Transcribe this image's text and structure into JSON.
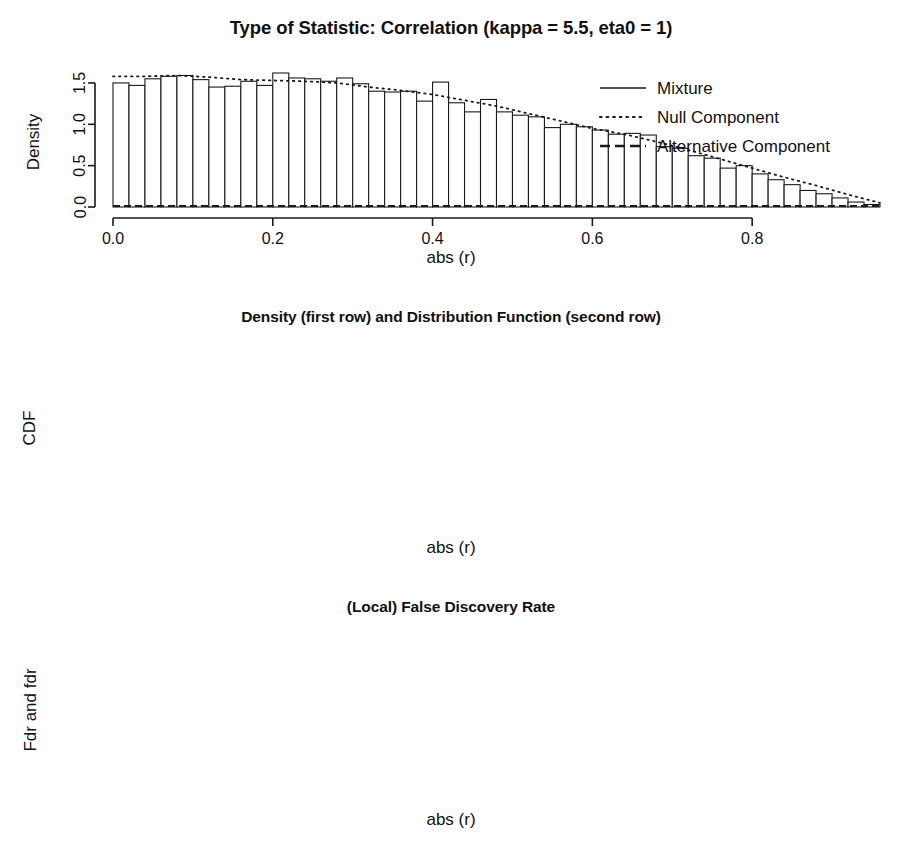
{
  "figure": {
    "width": 902,
    "height": 862,
    "background": "#ffffff",
    "foreground": "#1a1a1a"
  },
  "panels": {
    "density": {
      "title": "Type of Statistic: Correlation (kappa = 5.5, eta0 = 1)",
      "xlabel": "abs (r)",
      "ylabel": "Density",
      "legend": {
        "mixture": "Mixture",
        "null_component": "Null Component",
        "alternative_component": "Alternative Component"
      }
    },
    "cdf": {
      "title": "Density (first row) and Distribution Function (second row)",
      "xlabel": "abs (r)",
      "ylabel": "CDF"
    },
    "fdr": {
      "title": "(Local) False Discovery Rate",
      "xlabel": "abs (r)",
      "ylabel": "Fdr and fdr",
      "legend": {
        "fdr": "fdr (density−based)",
        "Fdr": "Fdr (tail area−based)"
      }
    }
  },
  "chart_data": [
    {
      "type": "bar",
      "id": "density-histogram",
      "title": "Type of Statistic: Correlation (kappa = 5.5, eta0 = 1)",
      "xlabel": "abs (r)",
      "ylabel": "Density",
      "xlim": [
        0,
        0.96
      ],
      "ylim": [
        0,
        1.62
      ],
      "xticks": [
        0.0,
        0.2,
        0.4,
        0.6,
        0.8
      ],
      "xticklabels": [
        "0.0",
        "0.2",
        "0.4",
        "0.6",
        "0.8"
      ],
      "yticks": [
        0.0,
        0.5,
        1.0,
        1.5
      ],
      "yticklabels": [
        "0.0",
        "0.5",
        "1.0",
        "1.5"
      ],
      "grid": false,
      "legend_position": "top-right",
      "bin_width": 0.02,
      "bin_starts": [
        0.0,
        0.02,
        0.04,
        0.06,
        0.08,
        0.1,
        0.12,
        0.14,
        0.16,
        0.18,
        0.2,
        0.22,
        0.24,
        0.26,
        0.28,
        0.3,
        0.32,
        0.34,
        0.36,
        0.38,
        0.4,
        0.42,
        0.44,
        0.46,
        0.48,
        0.5,
        0.52,
        0.54,
        0.56,
        0.58,
        0.6,
        0.62,
        0.64,
        0.66,
        0.68,
        0.7,
        0.72,
        0.74,
        0.76,
        0.78,
        0.8,
        0.82,
        0.84,
        0.86,
        0.88,
        0.9,
        0.92,
        0.94
      ],
      "values": [
        1.5,
        1.47,
        1.55,
        1.58,
        1.59,
        1.54,
        1.45,
        1.46,
        1.52,
        1.47,
        1.62,
        1.56,
        1.55,
        1.52,
        1.56,
        1.49,
        1.4,
        1.39,
        1.4,
        1.28,
        1.51,
        1.26,
        1.15,
        1.3,
        1.15,
        1.11,
        1.09,
        0.96,
        1.0,
        0.97,
        0.93,
        0.88,
        0.89,
        0.87,
        0.73,
        0.71,
        0.62,
        0.59,
        0.47,
        0.5,
        0.4,
        0.33,
        0.27,
        0.2,
        0.16,
        0.11,
        0.06,
        0.03
      ],
      "series": [
        {
          "name": "Mixture",
          "style": "solid",
          "note": "mixture density traced over histogram bar tops"
        },
        {
          "name": "Null Component",
          "style": "dotted",
          "x": [
            0.0,
            0.04,
            0.08,
            0.12,
            0.16,
            0.2,
            0.24,
            0.28,
            0.32,
            0.36,
            0.4,
            0.44,
            0.48,
            0.52,
            0.56,
            0.6,
            0.64,
            0.68,
            0.72,
            0.76,
            0.8,
            0.84,
            0.88,
            0.92,
            0.96
          ],
          "values": [
            1.58,
            1.58,
            1.59,
            1.57,
            1.54,
            1.53,
            1.52,
            1.5,
            1.45,
            1.41,
            1.36,
            1.29,
            1.22,
            1.13,
            1.04,
            0.95,
            0.88,
            0.79,
            0.69,
            0.58,
            0.47,
            0.36,
            0.26,
            0.15,
            0.05
          ]
        },
        {
          "name": "Alternative Component",
          "style": "dashed",
          "note": "flat near zero, obscured by histogram"
        }
      ]
    },
    {
      "type": "line",
      "id": "cdf-curve",
      "title": "Density (first row) and Distribution Function (second row)",
      "xlabel": "abs (r)",
      "ylabel": "CDF",
      "xlim": [
        0,
        0.96
      ],
      "ylim": [
        0,
        1.0
      ],
      "xticks": [
        0.0,
        0.2,
        0.4,
        0.6,
        0.8
      ],
      "xticklabels": [
        "0.0",
        "0.2",
        "0.4",
        "0.6",
        "0.8"
      ],
      "yticks": [
        0.0,
        0.4,
        0.8
      ],
      "yticklabels": [
        "0.0",
        "0.4",
        "0.8"
      ],
      "grid": false,
      "series": [
        {
          "name": "CDF",
          "style": "solid",
          "x": [
            0.0,
            0.05,
            0.1,
            0.15,
            0.2,
            0.25,
            0.3,
            0.35,
            0.4,
            0.45,
            0.5,
            0.55,
            0.6,
            0.65,
            0.7,
            0.75,
            0.8,
            0.85,
            0.9,
            0.95
          ],
          "values": [
            0.0,
            0.079,
            0.158,
            0.235,
            0.311,
            0.385,
            0.456,
            0.524,
            0.589,
            0.65,
            0.707,
            0.759,
            0.807,
            0.85,
            0.887,
            0.919,
            0.945,
            0.965,
            0.979,
            0.987
          ]
        }
      ]
    },
    {
      "type": "line",
      "id": "fdr-curves",
      "title": "(Local) False Discovery Rate",
      "xlabel": "abs (r)",
      "ylabel": "Fdr and fdr",
      "xlim": [
        0,
        0.96
      ],
      "ylim": [
        0,
        1.0
      ],
      "xticks": [
        0.0,
        0.2,
        0.4,
        0.6,
        0.8
      ],
      "xticklabels": [
        "0.0",
        "0.2",
        "0.4",
        "0.6",
        "0.8"
      ],
      "yticks": [
        0.0,
        0.4,
        0.8
      ],
      "yticklabels": [
        "0.0",
        "0.4",
        "0.8"
      ],
      "grid": false,
      "legend_position": "middle-left",
      "series": [
        {
          "name": "fdr (density−based)",
          "style": "solid",
          "x": [
            0.0,
            0.2,
            0.4,
            0.6,
            0.8,
            0.95
          ],
          "values": [
            1.0,
            1.0,
            1.0,
            1.0,
            1.0,
            1.0
          ]
        },
        {
          "name": "Fdr (tail area−based)",
          "style": "dotted",
          "x": [
            0.0,
            0.2,
            0.4,
            0.6,
            0.8,
            0.95
          ],
          "values": [
            1.0,
            1.0,
            1.0,
            1.0,
            1.0,
            1.0
          ]
        }
      ]
    }
  ]
}
